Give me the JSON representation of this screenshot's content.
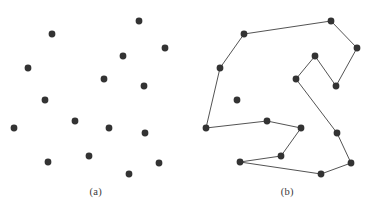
{
  "figure": {
    "type": "tsp-illustration",
    "background_color": "#ffffff",
    "point_color": "#333333",
    "edge_color": "#404040",
    "point_radius": 3.4,
    "edge_width": 0.9
  },
  "panels": [
    {
      "id": "panel-a",
      "caption": "(a)",
      "description": "scatter of points",
      "has_edges": false,
      "points": [
        {
          "id": 1,
          "x": 52,
          "y": 34
        },
        {
          "id": 2,
          "x": 28,
          "y": 68
        },
        {
          "id": 3,
          "x": 45,
          "y": 100
        },
        {
          "id": 4,
          "x": 14,
          "y": 128
        },
        {
          "id": 5,
          "x": 48,
          "y": 162
        },
        {
          "id": 6,
          "x": 139,
          "y": 21
        },
        {
          "id": 7,
          "x": 123,
          "y": 56
        },
        {
          "id": 8,
          "x": 165,
          "y": 48
        },
        {
          "id": 9,
          "x": 104,
          "y": 79
        },
        {
          "id": 10,
          "x": 144,
          "y": 86
        },
        {
          "id": 11,
          "x": 75,
          "y": 121
        },
        {
          "id": 12,
          "x": 109,
          "y": 128
        },
        {
          "id": 13,
          "x": 145,
          "y": 133
        },
        {
          "id": 14,
          "x": 89,
          "y": 156
        },
        {
          "id": 15,
          "x": 129,
          "y": 174
        },
        {
          "id": 16,
          "x": 159,
          "y": 163
        }
      ]
    },
    {
      "id": "panel-b",
      "caption": "(b)",
      "description": "same points joined by a closed tour",
      "has_edges": true,
      "points": [
        {
          "id": 1,
          "x": 52,
          "y": 34
        },
        {
          "id": 2,
          "x": 28,
          "y": 68
        },
        {
          "id": 3,
          "x": 45,
          "y": 100
        },
        {
          "id": 4,
          "x": 14,
          "y": 128
        },
        {
          "id": 5,
          "x": 48,
          "y": 162
        },
        {
          "id": 6,
          "x": 139,
          "y": 21
        },
        {
          "id": 7,
          "x": 123,
          "y": 56
        },
        {
          "id": 8,
          "x": 165,
          "y": 48
        },
        {
          "id": 9,
          "x": 104,
          "y": 79
        },
        {
          "id": 10,
          "x": 144,
          "y": 86
        },
        {
          "id": 11,
          "x": 75,
          "y": 121
        },
        {
          "id": 12,
          "x": 109,
          "y": 128
        },
        {
          "id": 13,
          "x": 145,
          "y": 133
        },
        {
          "id": 14,
          "x": 89,
          "y": 156
        },
        {
          "id": 15,
          "x": 129,
          "y": 174
        },
        {
          "id": 16,
          "x": 159,
          "y": 163
        }
      ],
      "tour": [
        1,
        6,
        8,
        10,
        7,
        9,
        13,
        16,
        15,
        5,
        14,
        12,
        11,
        4,
        2,
        1
      ],
      "closed": true
    }
  ]
}
